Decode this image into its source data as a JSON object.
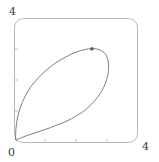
{
  "figure": {
    "name": "parametric-loop-plot",
    "frame_color": "#b9b9b9",
    "curve_color": "#6e6e72",
    "marker_color": "#55555a",
    "background": "#ffffff"
  },
  "axes": {
    "y_max_label": "4",
    "origin_label": "0",
    "x_max_label": "4",
    "x_tick_labels": [
      "0",
      "",
      "",
      "",
      "4"
    ],
    "y_tick_labels": [
      "0",
      "",
      "",
      "",
      "4"
    ]
  },
  "chart_data": {
    "type": "line",
    "title": "",
    "subtitle": "",
    "xlabel": "",
    "ylabel": "",
    "xlim": [
      0,
      4
    ],
    "ylim": [
      0,
      4
    ],
    "xticks": [
      0,
      1,
      2,
      3,
      4
    ],
    "yticks": [
      0,
      1,
      2,
      3,
      4
    ],
    "xticklabels": [
      "0",
      "",
      "",
      "",
      "4"
    ],
    "yticklabels": [
      "",
      "",
      "",
      "",
      "4"
    ],
    "grid": false,
    "legend": null,
    "legend_position": "none",
    "frame": "rounded-box",
    "series": [
      {
        "name": "parametric-loop",
        "closed": true,
        "x": [
          0.02,
          0.03,
          0.08,
          0.18,
          0.33,
          0.52,
          0.76,
          1.02,
          1.3,
          1.6,
          1.9,
          2.18,
          2.44,
          2.66,
          2.84,
          2.97,
          3.05,
          3.07,
          3.04,
          2.96,
          2.84,
          2.68,
          2.5,
          2.3,
          2.08,
          1.86,
          1.63,
          1.4,
          1.17,
          0.96,
          0.76,
          0.58,
          0.42,
          0.29,
          0.18,
          0.1,
          0.05,
          0.02
        ],
        "y": [
          0.1,
          0.42,
          0.78,
          1.14,
          1.48,
          1.8,
          2.08,
          2.33,
          2.55,
          2.73,
          2.88,
          2.98,
          3.03,
          3.03,
          2.97,
          2.85,
          2.66,
          2.42,
          2.16,
          1.9,
          1.65,
          1.42,
          1.22,
          1.04,
          0.89,
          0.76,
          0.65,
          0.56,
          0.47,
          0.4,
          0.33,
          0.27,
          0.22,
          0.17,
          0.13,
          0.09,
          0.05,
          0.1
        ]
      }
    ],
    "points": [
      {
        "name": "marked-point",
        "x": 2.52,
        "y": 3.03,
        "style": "filled-square",
        "size": 3
      }
    ]
  }
}
